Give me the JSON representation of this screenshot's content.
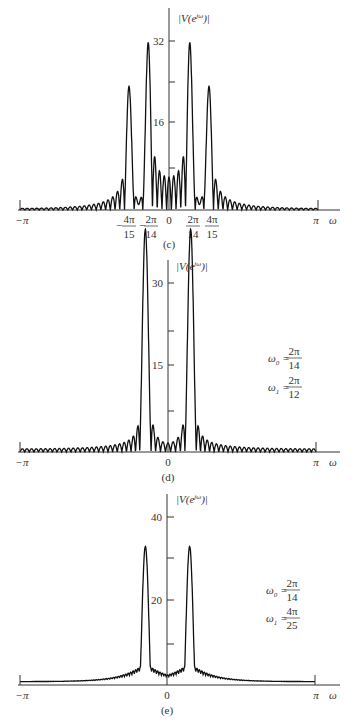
{
  "chart_data": [
    {
      "type": "line",
      "panel": "(c)",
      "caption": "(c)",
      "ylabel": "|V(e^{jω})|",
      "xlabel": "ω",
      "xlim": [
        "-π",
        "π"
      ],
      "ylim": [
        0,
        35
      ],
      "yticks": [
        {
          "value": 16,
          "label": "16"
        },
        {
          "value": 32,
          "label": "32"
        }
      ],
      "yminor_ticks": [
        8,
        24
      ],
      "xticks": [
        "-π",
        "-4π/15",
        "-2π/14",
        "0",
        "2π/14",
        "4π/15",
        "π"
      ],
      "peaks": [
        {
          "x": "-4π/15",
          "y": 24
        },
        {
          "x": "-2π/14",
          "y": 32
        },
        {
          "x": "2π/14",
          "y": 32
        },
        {
          "x": "4π/15",
          "y": 24
        }
      ],
      "sidelobe_level_far": 1.5,
      "sidelobe_level_near": 6
    },
    {
      "type": "line",
      "panel": "(d)",
      "caption": "(d)",
      "ylabel": "|V(e^{jω})|",
      "xlabel": "ω",
      "xlim": [
        "-π",
        "π"
      ],
      "ylim": [
        0,
        35
      ],
      "yticks": [
        {
          "value": 15,
          "label": "15"
        },
        {
          "value": 30,
          "label": "30"
        }
      ],
      "yminor_ticks": [
        7.5,
        22.5
      ],
      "xticks": [
        "-π",
        "0",
        "π"
      ],
      "annotation": {
        "omega0": "ω₀ = 2π/14",
        "omega1": "ω₁ = 2π/12"
      },
      "peaks": [
        {
          "x": "-2π/14",
          "y": 29
        },
        {
          "x": "-2π/12",
          "y": 22
        },
        {
          "x": "2π/14",
          "y": 29
        },
        {
          "x": "2π/12",
          "y": 22
        }
      ],
      "sidelobe_level_far": 1.5,
      "sidelobe_level_near": 9
    },
    {
      "type": "line",
      "panel": "(e)",
      "caption": "(e)",
      "ylabel": "|V(e^{jω})|",
      "xlabel": "ω",
      "xlim": [
        "-π",
        "π"
      ],
      "ylim": [
        0,
        46
      ],
      "yticks": [
        {
          "value": 20,
          "label": "20"
        },
        {
          "value": 40,
          "label": "40"
        }
      ],
      "yminor_ticks": [
        10,
        30
      ],
      "xticks": [
        "-π",
        "0",
        "π"
      ],
      "annotation": {
        "omega0": "ω₀ = 2π/14",
        "omega1": "ω₁ = 4π/25"
      },
      "peaks": [
        {
          "x": "-0.15π",
          "y": 33
        },
        {
          "x": "0.15π",
          "y": 33
        }
      ],
      "sidelobe_level_far": 0.8,
      "sidelobe_level_near": 5
    }
  ],
  "labels": {
    "ylabel": "|V(e",
    "ylabel_sup": "jω",
    "ylabel_end": ")|",
    "omega": "ω",
    "neg_pi": "−π",
    "pi": "π",
    "zero": "0",
    "c": {
      "caption": "(c)",
      "y16": "16",
      "y32": "32",
      "t1_num": "4π",
      "t1_den": "15",
      "t2_num": "2π",
      "t2_den": "14",
      "t3_num": "2π",
      "t3_den": "14",
      "t4_num": "4π",
      "t4_den": "15",
      "minus": "−"
    },
    "d": {
      "caption": "(d)",
      "y15": "15",
      "y30": "30",
      "w0": "ω",
      "w0_sub": "0",
      "w0_eq": "=",
      "w0_num": "2π",
      "w0_den": "14",
      "w1": "ω",
      "w1_sub": "1",
      "w1_eq": "=",
      "w1_num": "2π",
      "w1_den": "12"
    },
    "e": {
      "caption": "(e)",
      "y20": "20",
      "y40": "40",
      "w0": "ω",
      "w0_sub": "0",
      "w0_eq": "=",
      "w0_num": "2π",
      "w0_den": "14",
      "w1": "ω",
      "w1_sub": "1",
      "w1_eq": "=",
      "w1_num": "4π",
      "w1_den": "25"
    }
  }
}
